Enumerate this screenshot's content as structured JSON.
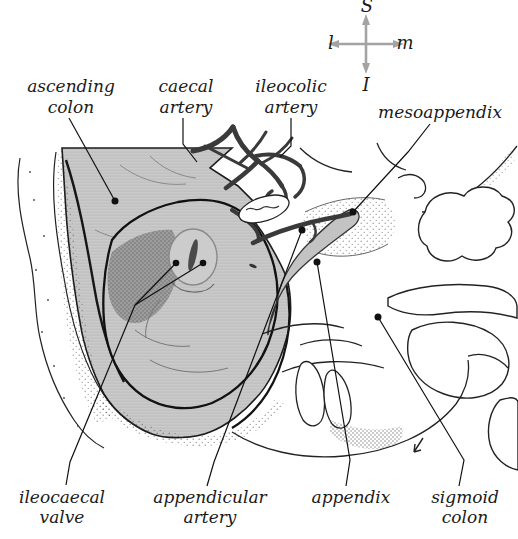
{
  "figure": {
    "compass": {
      "top": "S",
      "left": "l",
      "right": "m",
      "bottom": "I"
    },
    "labels": {
      "ascending_colon": {
        "line1": "ascending",
        "line2": "colon"
      },
      "caecal_artery": {
        "line1": "caecal",
        "line2": "artery"
      },
      "ileocolic_artery": {
        "line1": "ileocolic",
        "line2": "artery"
      },
      "mesoappendix": {
        "line1": "mesoappendix"
      },
      "ileocaecal_valve": {
        "line1": "ileocaecal",
        "line2": "valve"
      },
      "appendicular_artery": {
        "line1": "appendicular",
        "line2": "artery"
      },
      "appendix": {
        "line1": "appendix"
      },
      "sigmoid_colon": {
        "line1": "sigmoid",
        "line2": "colon"
      }
    },
    "palette": {
      "ink": "#1a1a1a",
      "artery": "#3a3a3a",
      "colon_gray": "#c6c6c6",
      "interior_gray": "#9d9d9d",
      "compass_gray": "#a3a3a3",
      "paper": "#ffffff"
    }
  }
}
